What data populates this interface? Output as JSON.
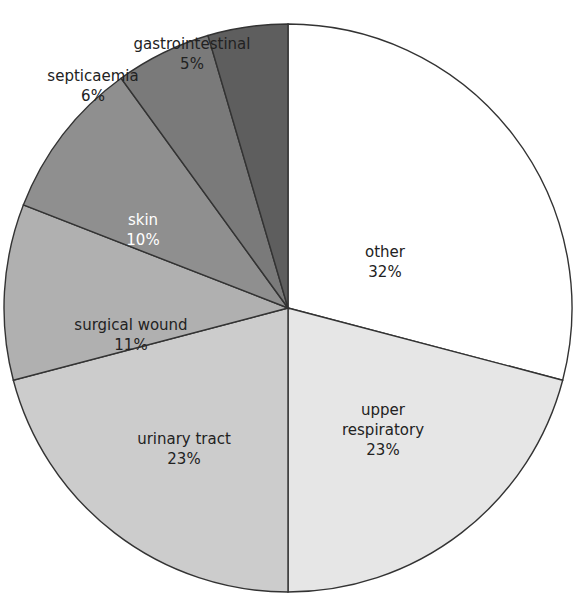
{
  "chart_data": {
    "type": "pie",
    "title": "",
    "start_angle_deg": 0,
    "direction": "clockwise",
    "slices": [
      {
        "label": "other",
        "value": 32,
        "pct_label": "32%",
        "color": "#ffffff",
        "text_color": "#222222",
        "label_lines": [
          "other",
          "32%"
        ],
        "label_pos": [
          385,
          257
        ],
        "label_outside": false
      },
      {
        "label": "upper respiratory",
        "value": 23,
        "pct_label": "23%",
        "color": "#e6e6e6",
        "text_color": "#222222",
        "label_lines": [
          "upper",
          "respiratory",
          "23%"
        ],
        "label_pos": [
          383,
          415
        ],
        "label_outside": false
      },
      {
        "label": "urinary tract",
        "value": 23,
        "pct_label": "23%",
        "color": "#cccccc",
        "text_color": "#222222",
        "label_lines": [
          "urinary tract",
          "23%"
        ],
        "label_pos": [
          184,
          444
        ],
        "label_outside": false
      },
      {
        "label": "surgical wound",
        "value": 11,
        "pct_label": "11%",
        "color": "#b0b0b0",
        "text_color": "#222222",
        "label_lines": [
          "surgical wound",
          "11%"
        ],
        "label_pos": [
          131,
          330
        ],
        "label_outside": false
      },
      {
        "label": "skin",
        "value": 10,
        "pct_label": "10%",
        "color": "#8f8f8f",
        "text_color": "#ffffff",
        "label_lines": [
          "skin",
          "10%"
        ],
        "label_pos": [
          143,
          225
        ],
        "label_outside": false
      },
      {
        "label": "septicaemia",
        "value": 6,
        "pct_label": "6%",
        "color": "#7a7a7a",
        "text_color": "#222222",
        "label_lines": [
          "septicaemia",
          "6%"
        ],
        "label_pos": [
          93,
          81
        ],
        "label_outside": true
      },
      {
        "label": "gastrointestinal",
        "value": 5,
        "pct_label": "5%",
        "color": "#5e5e5e",
        "text_color": "#222222",
        "label_lines": [
          "gastrointestinal",
          "5%"
        ],
        "label_pos": [
          192,
          49
        ],
        "label_outside": true
      }
    ],
    "legend": "none (labels on slices)"
  },
  "layout": {
    "center": [
      288,
      308
    ],
    "radius": 284,
    "stroke": "#333333"
  }
}
